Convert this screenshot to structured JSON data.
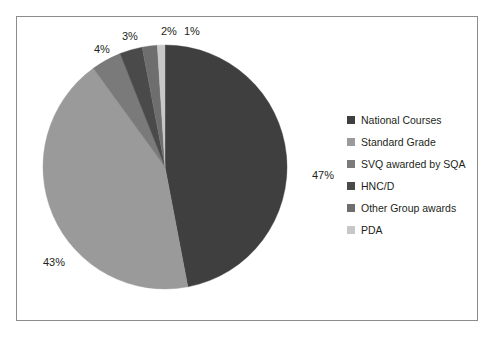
{
  "chart_data": {
    "type": "pie",
    "title": "",
    "categories": [
      "National Courses",
      "Standard Grade",
      "SVQ awarded by SQA",
      "HNC/D",
      "Other Group awards",
      "PDA"
    ],
    "values": [
      47,
      43,
      4,
      3,
      2,
      1
    ],
    "value_labels": [
      "47%",
      "43%",
      "4%",
      "3%",
      "2%",
      "1%"
    ],
    "unit": "%",
    "colors": [
      "#3f3f3f",
      "#9a9a9a",
      "#7a7a7a",
      "#4a4a4a",
      "#6e6e6e",
      "#c8c8c8"
    ],
    "legend_position": "right",
    "start_angle_deg": 0,
    "direction": "clockwise",
    "grid": false,
    "xlabel": "",
    "ylabel": ""
  },
  "legend": {
    "items": [
      {
        "label": "National Courses",
        "color": "#3f3f3f"
      },
      {
        "label": "Standard Grade",
        "color": "#9a9a9a"
      },
      {
        "label": "SVQ awarded by SQA",
        "color": "#7a7a7a"
      },
      {
        "label": "HNC/D",
        "color": "#4a4a4a"
      },
      {
        "label": "Other Group awards",
        "color": "#6e6e6e"
      },
      {
        "label": "PDA",
        "color": "#c8c8c8"
      }
    ]
  },
  "labels": {
    "national_courses": "47%",
    "standard_grade": "43%",
    "svq": "4%",
    "hncd": "3%",
    "other_group": "2%",
    "pda": "1%"
  },
  "style": {
    "border_color": "#8c8c8c",
    "background": "#ffffff",
    "text_color": "#231f20"
  }
}
